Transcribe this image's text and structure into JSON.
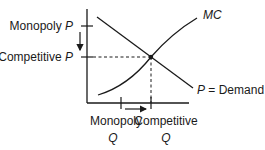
{
  "diagram": {
    "colors": {
      "ink": "#1a1a1a",
      "background": "#ffffff"
    },
    "labels": {
      "monopoly_p_word": "Monopoly ",
      "monopoly_p_var": "P",
      "competitive_p_word": "Competitive ",
      "competitive_p_var": "P",
      "mc": "MC",
      "demand_var": "P",
      "demand_eq": " = Demand",
      "monopoly_q_word": "Monopoly",
      "monopoly_q_var": "Q",
      "competitive_q_word": "Competitive",
      "competitive_q_var": "Q"
    },
    "curves": [
      {
        "name": "MC",
        "shape": "upward-sloping convex curve"
      },
      {
        "name": "Demand",
        "shape": "downward-sloping line"
      }
    ],
    "annotations": [
      {
        "type": "arrow",
        "direction": "down",
        "meaning": "price falls from monopoly to competitive level"
      },
      {
        "type": "arrow",
        "direction": "right",
        "meaning": "quantity rises from monopoly to competitive level"
      },
      {
        "type": "dashed-guides",
        "meaning": "competitive equilibrium at MC = Demand intersection"
      }
    ]
  }
}
